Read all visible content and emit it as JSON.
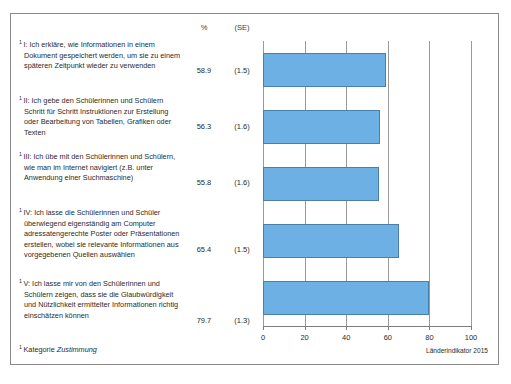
{
  "figure": {
    "column_headers": {
      "percent": "%",
      "se": "(SE)"
    },
    "footnote_marker": "1",
    "footnote_text_plain": "Kategorie ",
    "footnote_text_italic": "Zustimmung",
    "source": "Länderindikator 2015"
  },
  "chart_data": {
    "type": "bar",
    "orientation": "horizontal",
    "title": "",
    "subtitle": "",
    "xlabel": "",
    "ylabel": "",
    "xlim": [
      0,
      100
    ],
    "xticks": [
      0,
      20,
      40,
      60,
      80,
      100
    ],
    "xtick_labels": [
      "0",
      "20",
      "40",
      "60",
      "80",
      "100"
    ],
    "grid": "vertical",
    "legend": "none",
    "bar_color": "#6CB0E4",
    "bar_border_color": "#4B7EA8",
    "categories": [
      "I: Ich erkläre, wie Informationen in einem Dokument gespeichert werden, um sie zu einem späteren Zeitpunkt wieder zu verwenden",
      "II: Ich gebe den Schülerinnen und Schülern Schritt für Schritt Instruktionen zur Erstellung oder Bearbeitung von Tabellen, Grafiken oder Texten",
      "III: Ich übe mit den Schülerinnen und Schülern, wie man im Internet navigiert (z.B. unter Anwendung einer Suchmaschine)",
      "IV: Ich lasse die Schülerinnen und Schüler überwiegend eigenständig am Computer adressatengerechte Poster oder Präsentationen erstellen, wobei sie relevante Informationen aus vorgegebenen Quellen auswählen",
      "V: Ich lasse mir von den Schülerinnen und Schülern zeigen, dass sie die Glaubwürdigkeit und Nützlichkeit ermittelter Informationen richtig einschätzen können"
    ],
    "values": [
      58.9,
      56.3,
      55.8,
      65.4,
      79.7
    ],
    "value_labels": [
      "58.9",
      "56.3",
      "55.8",
      "65.4",
      "79.7"
    ],
    "standard_errors": [
      1.5,
      1.6,
      1.6,
      1.5,
      1.3
    ],
    "se_labels": [
      "(1.5)",
      "(1.6)",
      "(1.6)",
      "(1.5)",
      "(1.3)"
    ]
  },
  "rows": [
    {
      "marker": "1",
      "label": "I: Ich erkläre, wie Informationen in einem Dokument gespeichert werden, um sie zu einem späteren Zeitpunkt wieder zu verwenden",
      "percent": "58.9",
      "se": "(1.5)",
      "value": 58.9
    },
    {
      "marker": "1",
      "label": "II: Ich gebe den Schülerinnen und Schülern Schritt für Schritt Instruktionen zur Erstellung oder Bearbeitung von Tabellen, Grafiken oder Texten",
      "percent": "56.3",
      "se": "(1.6)",
      "value": 56.3
    },
    {
      "marker": "1",
      "label": "III: Ich übe mit den Schülerinnen und Schülern, wie man im Internet navigiert (z.B. unter Anwendung einer Suchmaschine)",
      "percent": "55.8",
      "se": "(1.6)",
      "value": 55.8
    },
    {
      "marker": "1",
      "label": "IV: Ich lasse die Schülerinnen und Schüler überwiegend eigenständig am Computer adressatengerechte Poster oder Präsentationen erstellen, wobei sie relevante Informationen aus vorgegebenen Quellen auswählen",
      "percent": "65.4",
      "se": "(1.5)",
      "value": 65.4
    },
    {
      "marker": "1",
      "label": "V: Ich lasse mir von den Schülerinnen und Schülern zeigen, dass sie die Glaubwürdigkeit und Nützlichkeit ermittelter Informationen richtig einschätzen können",
      "percent": "79.7",
      "se": "(1.3)",
      "value": 79.7
    }
  ]
}
